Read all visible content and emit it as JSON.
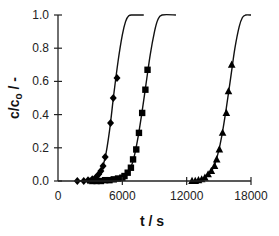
{
  "chart_data": {
    "type": "scatter",
    "title": "",
    "xlabel": "t / s",
    "ylabel": "c/c₀ / -",
    "xlim": [
      0,
      18000
    ],
    "ylim": [
      0.0,
      1.0
    ],
    "x_ticks": [
      0,
      6000,
      12000,
      18000
    ],
    "x_tick_labels": [
      "0",
      "6000",
      "12000",
      "18000"
    ],
    "y_ticks": [
      0.0,
      0.2,
      0.4,
      0.6,
      0.8,
      1.0
    ],
    "y_tick_labels": [
      "0.0",
      "0.2",
      "0.4",
      "0.6",
      "0.8",
      "1.0"
    ],
    "grid": false,
    "legend": null,
    "series": [
      {
        "name": "diamond",
        "marker": "diamond",
        "points": [
          [
            1800,
            0.0
          ],
          [
            2400,
            0.0
          ],
          [
            2800,
            0.005
          ],
          [
            3200,
            0.01
          ],
          [
            3500,
            0.02
          ],
          [
            3800,
            0.04
          ],
          [
            4000,
            0.06
          ],
          [
            4200,
            0.09
          ],
          [
            4400,
            0.145
          ],
          [
            4900,
            0.35
          ],
          [
            5150,
            0.5
          ],
          [
            5500,
            0.62
          ]
        ],
        "fit_curve": [
          [
            1800,
            0.0
          ],
          [
            3000,
            0.005
          ],
          [
            3600,
            0.025
          ],
          [
            4000,
            0.06
          ],
          [
            4400,
            0.14
          ],
          [
            4800,
            0.3
          ],
          [
            5200,
            0.52
          ],
          [
            5600,
            0.72
          ],
          [
            6000,
            0.88
          ],
          [
            6300,
            0.96
          ],
          [
            6600,
            0.995
          ],
          [
            7000,
            1.0
          ],
          [
            8000,
            1.0
          ]
        ]
      },
      {
        "name": "square",
        "marker": "square",
        "points": [
          [
            3200,
            0.0
          ],
          [
            3600,
            0.0
          ],
          [
            4000,
            0.0
          ],
          [
            4400,
            0.005
          ],
          [
            4800,
            0.005
          ],
          [
            5200,
            0.01
          ],
          [
            5600,
            0.015
          ],
          [
            6000,
            0.02
          ],
          [
            6200,
            0.03
          ],
          [
            6500,
            0.05
          ],
          [
            6800,
            0.08
          ],
          [
            7000,
            0.13
          ],
          [
            7300,
            0.19
          ],
          [
            7550,
            0.29
          ],
          [
            7850,
            0.41
          ],
          [
            8150,
            0.55
          ],
          [
            8350,
            0.67
          ]
        ],
        "fit_curve": [
          [
            3200,
            0.0
          ],
          [
            5000,
            0.005
          ],
          [
            6000,
            0.02
          ],
          [
            6600,
            0.06
          ],
          [
            7000,
            0.12
          ],
          [
            7400,
            0.24
          ],
          [
            7800,
            0.4
          ],
          [
            8200,
            0.58
          ],
          [
            8600,
            0.76
          ],
          [
            9000,
            0.9
          ],
          [
            9300,
            0.97
          ],
          [
            9700,
            1.0
          ],
          [
            11000,
            1.0
          ]
        ]
      },
      {
        "name": "triangle",
        "marker": "triangle",
        "points": [
          [
            12500,
            0.0
          ],
          [
            12800,
            0.0
          ],
          [
            13100,
            0.005
          ],
          [
            13400,
            0.01
          ],
          [
            13700,
            0.02
          ],
          [
            14000,
            0.04
          ],
          [
            14300,
            0.06
          ],
          [
            14600,
            0.09
          ],
          [
            14800,
            0.13
          ],
          [
            15050,
            0.19
          ],
          [
            15350,
            0.29
          ],
          [
            15700,
            0.41
          ],
          [
            15900,
            0.54
          ],
          [
            16200,
            0.7
          ]
        ],
        "fit_curve": [
          [
            12400,
            0.0
          ],
          [
            13400,
            0.01
          ],
          [
            14000,
            0.035
          ],
          [
            14500,
            0.08
          ],
          [
            14900,
            0.16
          ],
          [
            15300,
            0.28
          ],
          [
            15700,
            0.44
          ],
          [
            16100,
            0.62
          ],
          [
            16500,
            0.8
          ],
          [
            16900,
            0.93
          ],
          [
            17200,
            0.985
          ],
          [
            17500,
            1.0
          ],
          [
            18000,
            1.0
          ]
        ]
      }
    ]
  },
  "layout": {
    "plot": {
      "x0": 58,
      "x1": 251,
      "y_top": 15,
      "y_bottom": 181
    },
    "colors": {
      "axis": "#222222",
      "curve": "#111111",
      "marker": "#000000"
    }
  }
}
